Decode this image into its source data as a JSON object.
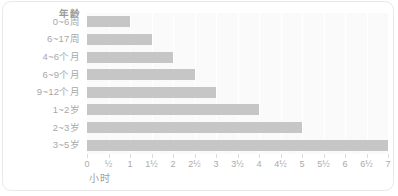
{
  "chart_data": {
    "type": "bar",
    "orientation": "horizontal",
    "title": "",
    "xlabel": "小时",
    "ylabel": "年龄",
    "categories": [
      "0~6周",
      "6~17周",
      "4~6个月",
      "6~9个月",
      "9~12个月",
      "1~2岁",
      "2~3岁",
      "3~5岁"
    ],
    "values": [
      1,
      1.5,
      2,
      2.5,
      3,
      4,
      5,
      7
    ],
    "xlim": [
      0,
      7
    ],
    "xticks": [
      0,
      0.5,
      1,
      1.5,
      2,
      2.5,
      3,
      3.5,
      4,
      4.5,
      5,
      5.5,
      6,
      6.5,
      7
    ],
    "xticklabels": [
      "0",
      "½",
      "1",
      "1½",
      "2",
      "2½",
      "3",
      "3½",
      "4",
      "4½",
      "5",
      "5½",
      "6",
      "6½",
      "7"
    ],
    "grid": true,
    "legend": false,
    "bar_color": "#c6c6c6",
    "plot_background": "#fafafa",
    "gridline_color": "#ffffff",
    "label_color": "#a8a8a8"
  }
}
